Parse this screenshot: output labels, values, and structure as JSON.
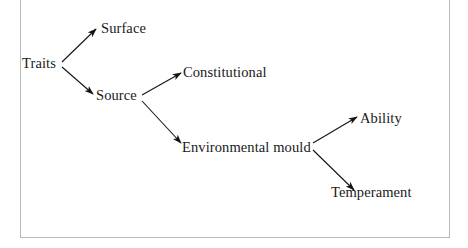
{
  "figure": {
    "type": "tree-diagram",
    "background_color": "#ffffff",
    "frame_color": "#b9b9b9",
    "text_color": "#1a1a1a",
    "arrow_color": "#141414"
  },
  "nodes": {
    "traits": {
      "label": "Traits",
      "x": 22,
      "y": 56
    },
    "surface": {
      "label": "Surface",
      "x": 101,
      "y": 21
    },
    "source": {
      "label": "Source",
      "x": 96,
      "y": 88
    },
    "constitutional": {
      "label": "Constitutional",
      "x": 183,
      "y": 65
    },
    "environmental_mould": {
      "label": "Environmental mould",
      "x": 182,
      "y": 140
    },
    "ability": {
      "label": "Ability",
      "x": 360,
      "y": 111
    },
    "temperament": {
      "label": "Temperament",
      "x": 331,
      "y": 185
    }
  },
  "edges": [
    {
      "name": "traits-to-surface",
      "from": "Traits",
      "to": "Surface"
    },
    {
      "name": "traits-to-source",
      "from": "Traits",
      "to": "Source"
    },
    {
      "name": "source-to-constitutional",
      "from": "Source",
      "to": "Constitutional"
    },
    {
      "name": "source-to-environmental-mould",
      "from": "Source",
      "to": "Environmental mould"
    },
    {
      "name": "environmental-mould-to-ability",
      "from": "Environmental mould",
      "to": "Ability"
    },
    {
      "name": "environmental-mould-to-temperament",
      "from": "Environmental mould",
      "to": "Temperament"
    }
  ]
}
